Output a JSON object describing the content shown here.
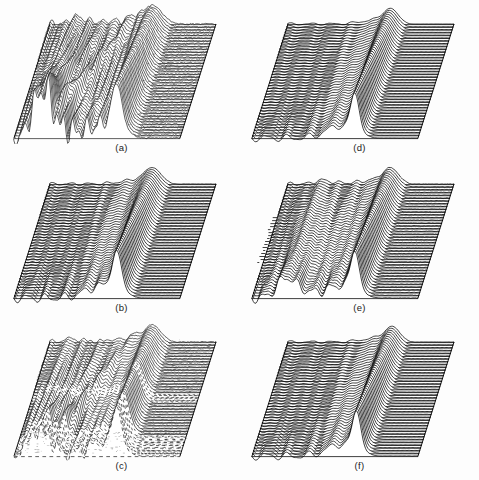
{
  "figure": {
    "background_color": "#fdfdfd",
    "line_color": "#000000",
    "width": 479,
    "height": 480,
    "columns": 2,
    "rows": 3
  },
  "panels": [
    {
      "id": "a",
      "caption": "(a)",
      "position": {
        "column": "left",
        "row": 1
      },
      "traces": 42,
      "artifact": "heavy-scan-noise",
      "description": "Strong multi-ridge interference pattern with large left-side spike cluster and arcing wavefront"
    },
    {
      "id": "b",
      "caption": "(b)",
      "position": {
        "column": "left",
        "row": 2
      },
      "traces": 42,
      "artifact": "dark-band",
      "description": "Single broad ridge with smooth left plateau and one heavy dark horizontal band"
    },
    {
      "id": "c",
      "caption": "(c)",
      "position": {
        "column": "left",
        "row": 3
      },
      "traces": 42,
      "artifact": "speckle-dropout",
      "description": "Ridge with mid-field dropout band and speckled lower region"
    },
    {
      "id": "d",
      "caption": "(d)",
      "position": {
        "column": "right",
        "row": 1
      },
      "traces": 42,
      "artifact": "none",
      "description": "Clean single sharp ridge, flat right field, gently rippled left field"
    },
    {
      "id": "e",
      "caption": "(e)",
      "position": {
        "column": "right",
        "row": 2
      },
      "traces": 42,
      "artifact": "left-edge-break",
      "description": "Sharp ridge with secondary left shoulder and broken left edge"
    },
    {
      "id": "f",
      "caption": "(f)",
      "position": {
        "column": "right",
        "row": 3
      },
      "traces": 42,
      "artifact": "dark-band",
      "description": "Clean sharp ridge with a single dark horizontal band in the lower half"
    }
  ],
  "chart_data": {
    "type": "line",
    "variant": "waterfall-stacked-traces",
    "xlabel": "",
    "ylabel": "",
    "grid": false,
    "legend": null,
    "shared_geometry": {
      "traces_per_panel": 42,
      "skew_dx": -36,
      "plot_width": 166,
      "plot_depth": 114,
      "top_left": [
        48,
        20
      ],
      "top_right": [
        214,
        20
      ],
      "bottom_left": [
        12,
        134
      ],
      "bottom_right": [
        178,
        134
      ]
    },
    "panels": [
      {
        "id": "a",
        "caption": "(a)",
        "ridge_center": 0.62,
        "ridge_amplitude": 34,
        "ridge_width": 0.055,
        "ripple_amplitude": 7.5,
        "ripple_frequency": 13,
        "secondary_ridge_center": 0.16,
        "secondary_amplitude": 26,
        "arc_feature": true,
        "noise_level": 0.55
      },
      {
        "id": "b",
        "caption": "(b)",
        "ridge_center": 0.62,
        "ridge_amplitude": 30,
        "ridge_width": 0.05,
        "ripple_amplitude": 3.2,
        "ripple_frequency": 9,
        "secondary_ridge_center": 0.0,
        "secondary_amplitude": 0,
        "arc_feature": false,
        "noise_level": 0.12
      },
      {
        "id": "c",
        "caption": "(c)",
        "ridge_center": 0.62,
        "ridge_amplitude": 31,
        "ridge_width": 0.05,
        "ripple_amplitude": 4.4,
        "ripple_frequency": 10,
        "secondary_ridge_center": 0.12,
        "secondary_amplitude": 12,
        "arc_feature": true,
        "noise_level": 0.35
      },
      {
        "id": "d",
        "caption": "(d)",
        "ridge_center": 0.62,
        "ridge_amplitude": 29,
        "ridge_width": 0.045,
        "ripple_amplitude": 2.6,
        "ripple_frequency": 8,
        "secondary_ridge_center": 0.0,
        "secondary_amplitude": 0,
        "arc_feature": false,
        "noise_level": 0.06
      },
      {
        "id": "e",
        "caption": "(e)",
        "ridge_center": 0.62,
        "ridge_amplitude": 30,
        "ridge_width": 0.047,
        "ripple_amplitude": 3.8,
        "ripple_frequency": 10,
        "secondary_ridge_center": 0.2,
        "secondary_amplitude": 14,
        "arc_feature": false,
        "noise_level": 0.2
      },
      {
        "id": "f",
        "caption": "(f)",
        "ridge_center": 0.63,
        "ridge_amplitude": 29,
        "ridge_width": 0.045,
        "ripple_amplitude": 2.8,
        "ripple_frequency": 8,
        "secondary_ridge_center": 0.0,
        "secondary_amplitude": 0,
        "arc_feature": false,
        "noise_level": 0.08
      }
    ]
  }
}
